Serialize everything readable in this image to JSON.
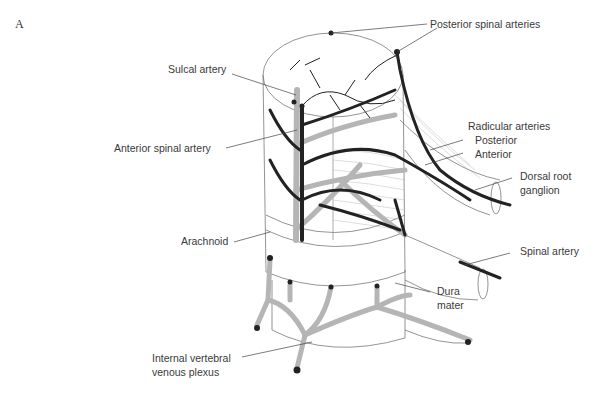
{
  "figure": {
    "panel_label": "A",
    "labels": {
      "posterior_spinal_arteries": "Posterior spinal arteries",
      "sulcal_artery": "Sulcal artery",
      "anterior_spinal_artery": "Anterior spinal artery",
      "radicular_arteries": "Radicular arteries",
      "posterior": "Posterior",
      "anterior": "Anterior",
      "dorsal_root_ganglion_1": "Dorsal root",
      "dorsal_root_ganglion_2": "ganglion",
      "arachnoid": "Arachnoid",
      "spinal_artery": "Spinal artery",
      "dura_mater_1": "Dura",
      "dura_mater_2": "mater",
      "venous_plexus_1": "Internal vertebral",
      "venous_plexus_2": "venous plexus"
    },
    "colors": {
      "artery_dark": "#222222",
      "vessel_grey": "#b5b5b5",
      "outline": "#555555",
      "leader_line": "#444444",
      "text": "#3a3a3a"
    }
  }
}
